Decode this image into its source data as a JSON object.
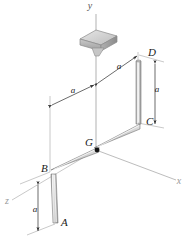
{
  "figure": {
    "kind": "engineering-mechanics-3d-bent-rod-diagram",
    "background_color": "#ffffff",
    "rod_fill_color": "#cfcfcf",
    "rod_highlight_color": "#f2f2f2",
    "rod_outline_color": "#6b6b6b",
    "axis_color": "#9a9a9a",
    "dimension_color": "#2b2b2b",
    "support_color": "#bdbdbd"
  },
  "axes": [
    {
      "name": "y-axis",
      "label": "y",
      "x": 90,
      "y": 9
    },
    {
      "name": "x-axis",
      "label": "x",
      "x": 179,
      "y": 184
    },
    {
      "name": "z-axis",
      "label": "z",
      "x": 7,
      "y": 204
    }
  ],
  "points": [
    {
      "name": "point-A",
      "label": "A",
      "x": 61,
      "y": 226
    },
    {
      "name": "point-B",
      "label": "B",
      "x": 41,
      "y": 172
    },
    {
      "name": "point-C",
      "label": "C",
      "x": 146,
      "y": 125
    },
    {
      "name": "point-D",
      "label": "D",
      "x": 148,
      "y": 56
    },
    {
      "name": "point-G",
      "label": "G",
      "x": 89,
      "y": 146
    }
  ],
  "dimensions": [
    {
      "name": "dimension-a-vertical-left",
      "label": "a",
      "x": 35,
      "y": 212
    },
    {
      "name": "dimension-a-vertical-right",
      "label": "a",
      "x": 157,
      "y": 92
    },
    {
      "name": "dimension-a-horizontal-left",
      "label": "a",
      "x": 73,
      "y": 93
    },
    {
      "name": "dimension-a-horizontal-right",
      "label": "a",
      "x": 119,
      "y": 69
    }
  ],
  "support": {
    "name": "bearing-block",
    "description": "square pillow-block bearing at top of vertical shaft"
  }
}
